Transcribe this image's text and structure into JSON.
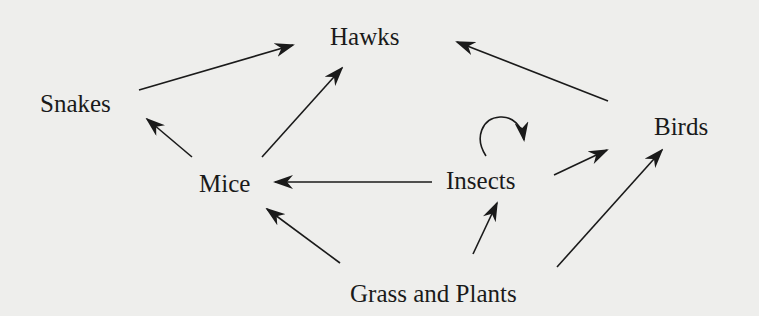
{
  "diagram": {
    "type": "food-web",
    "background": "#eeeeec",
    "ink_color": "#1a1a1a",
    "nodes": [
      {
        "id": "hawks",
        "label": "Hawks",
        "x": 330,
        "y": 24
      },
      {
        "id": "snakes",
        "label": "Snakes",
        "x": 40,
        "y": 91
      },
      {
        "id": "birds",
        "label": "Birds",
        "x": 654,
        "y": 114
      },
      {
        "id": "mice",
        "label": "Mice",
        "x": 199,
        "y": 171
      },
      {
        "id": "insects",
        "label": "Insects",
        "x": 446,
        "y": 168
      },
      {
        "id": "grass",
        "label": "Grass and Plants",
        "x": 350,
        "y": 281
      }
    ],
    "edges": [
      {
        "from": "snakes",
        "to": "hawks",
        "x1": 139,
        "y1": 90,
        "x2": 293,
        "y2": 45
      },
      {
        "from": "mice",
        "to": "hawks",
        "x1": 262,
        "y1": 157,
        "x2": 342,
        "y2": 68
      },
      {
        "from": "mice",
        "to": "snakes",
        "x1": 192,
        "y1": 157,
        "x2": 147,
        "y2": 119
      },
      {
        "from": "birds",
        "to": "hawks",
        "x1": 608,
        "y1": 101,
        "x2": 457,
        "y2": 42
      },
      {
        "from": "insects",
        "to": "mice",
        "x1": 432,
        "y1": 182,
        "x2": 275,
        "y2": 182
      },
      {
        "from": "insects",
        "to": "birds",
        "x1": 554,
        "y1": 175,
        "x2": 607,
        "y2": 150
      },
      {
        "from": "grass",
        "to": "mice",
        "x1": 340,
        "y1": 263,
        "x2": 267,
        "y2": 209
      },
      {
        "from": "grass",
        "to": "insects",
        "x1": 473,
        "y1": 254,
        "x2": 497,
        "y2": 203
      },
      {
        "from": "grass",
        "to": "birds",
        "x1": 557,
        "y1": 267,
        "x2": 662,
        "y2": 150
      },
      {
        "from": "insects",
        "to": "insects",
        "self_loop": true
      }
    ]
  }
}
